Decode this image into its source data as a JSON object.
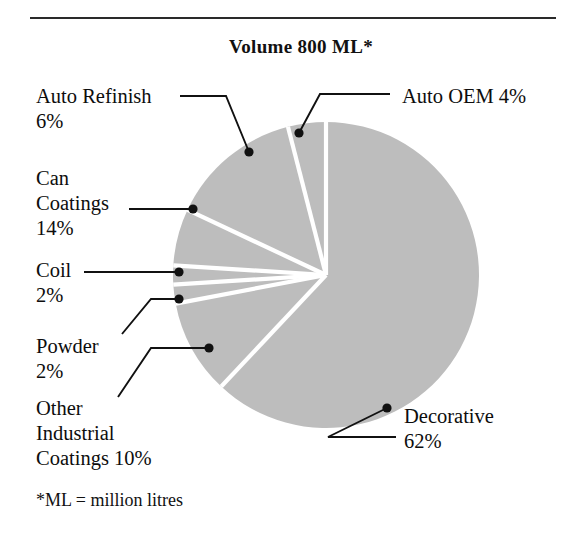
{
  "figure": {
    "title": "Volume 800 ML*",
    "footnote": "*ML = million litres",
    "rule": "horizontal-rule",
    "gray_fill": "#bdbdbd",
    "separator_color": "#ffffff",
    "text_color": "#0d0d0d"
  },
  "labels": {
    "auto_refinish": "Auto Refinish\n6%",
    "can_coatings": "Can\nCoatings\n14%",
    "coil": "Coil\n2%",
    "powder": "Powder\n2%",
    "other_industrial": "Other\nIndustrial\nCoatings 10%",
    "decorative": "Decorative\n62%",
    "auto_oem": "Auto OEM 4%"
  },
  "chart_data": {
    "type": "pie",
    "title": "Volume 800 ML*",
    "subtitle": "",
    "units": "ML (million litres)",
    "total": 800,
    "total_label": "800 ML",
    "value_unit": "percent",
    "start_angle_deg": 0,
    "direction": "clockwise",
    "legend": "callout-labels",
    "grid": false,
    "categories": [
      "Decorative",
      "Can Coatings",
      "Other Industrial Coatings",
      "Auto Refinish",
      "Auto OEM",
      "Coil",
      "Powder"
    ],
    "values": [
      62,
      14,
      10,
      6,
      4,
      2,
      2
    ],
    "slices": [
      {
        "label": "Decorative",
        "value": 62,
        "value_text": "62%",
        "color": "#bdbdbd"
      },
      {
        "label": "Can Coatings",
        "value": 14,
        "value_text": "14%",
        "color": "#bdbdbd"
      },
      {
        "label": "Other Industrial Coatings",
        "value": 10,
        "value_text": "10%",
        "color": "#bdbdbd"
      },
      {
        "label": "Auto Refinish",
        "value": 6,
        "value_text": "6%",
        "color": "#bdbdbd"
      },
      {
        "label": "Auto OEM",
        "value": 4,
        "value_text": "4%",
        "color": "#bdbdbd"
      },
      {
        "label": "Coil",
        "value": 2,
        "value_text": "2%",
        "color": "#bdbdbd"
      },
      {
        "label": "Powder",
        "value": 2,
        "value_text": "2%",
        "color": "#bdbdbd"
      }
    ]
  }
}
